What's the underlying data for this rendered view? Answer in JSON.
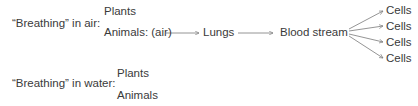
{
  "air": {
    "heading": "“Breathing” in air:",
    "plants": "Plants",
    "animals": "Animals: (air)",
    "lungs": "Lungs",
    "blood": "Blood stream",
    "cells": [
      "Cells",
      "Cells",
      "Cells",
      "Cells"
    ]
  },
  "water": {
    "heading": "“Breathing” in water:",
    "plants": "Plants",
    "animals": "Animals"
  },
  "colors": {
    "text": "#3a3a3a",
    "line": "#7a7a7a"
  }
}
